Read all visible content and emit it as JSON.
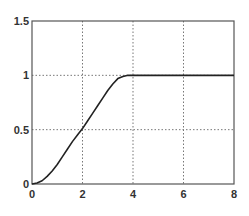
{
  "chart_data": {
    "type": "line",
    "title": "",
    "xlabel": "",
    "ylabel": "",
    "xlim": [
      0,
      8
    ],
    "ylim": [
      0,
      1.5
    ],
    "grid": true,
    "x_ticks": [
      0,
      2,
      4,
      6,
      8
    ],
    "x_tick_labels": [
      "0",
      "2",
      "4",
      "6",
      "8"
    ],
    "y_ticks": [
      0,
      0.5,
      1,
      1.5
    ],
    "y_tick_labels": [
      "0",
      "0.5",
      "1",
      "1.5"
    ],
    "series": [
      {
        "name": "response",
        "color": "#222222",
        "x": [
          0,
          0.2,
          0.4,
          0.6,
          0.8,
          1.0,
          1.2,
          1.4,
          1.6,
          1.8,
          2.0,
          2.2,
          2.4,
          2.6,
          2.8,
          3.0,
          3.2,
          3.4,
          3.6,
          3.8,
          4.0,
          5.0,
          6.0,
          7.0,
          8.0
        ],
        "y": [
          0,
          0.01,
          0.03,
          0.07,
          0.12,
          0.18,
          0.25,
          0.32,
          0.39,
          0.45,
          0.51,
          0.58,
          0.65,
          0.72,
          0.79,
          0.86,
          0.92,
          0.97,
          0.99,
          1.0,
          1.0,
          1.0,
          1.0,
          1.0,
          1.0
        ]
      }
    ]
  }
}
